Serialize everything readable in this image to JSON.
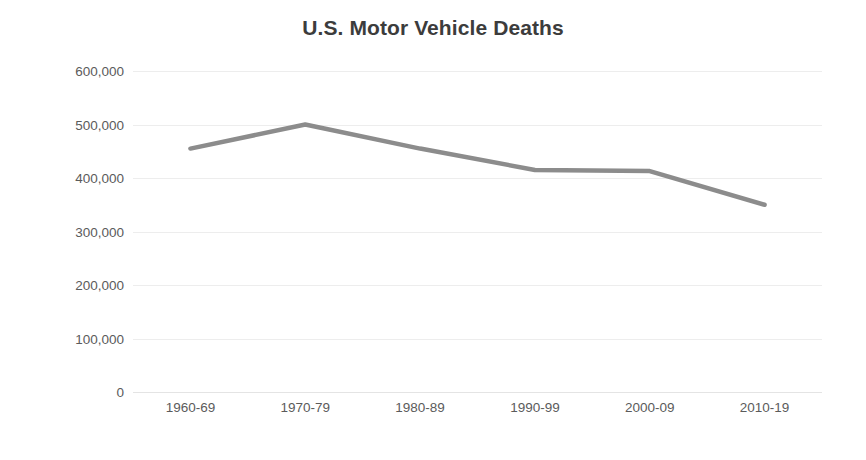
{
  "chart_data": {
    "type": "line",
    "title": "U.S. Motor Vehicle Deaths",
    "xlabel": "",
    "ylabel": "",
    "categories": [
      "1960-69",
      "1970-79",
      "1980-89",
      "1990-99",
      "2000-09",
      "2010-19"
    ],
    "values": [
      455000,
      500000,
      455000,
      415000,
      413000,
      350000
    ],
    "series": [
      {
        "name": "U.S. Motor Vehicle Deaths",
        "values": [
          455000,
          500000,
          455000,
          415000,
          413000,
          350000
        ]
      }
    ],
    "ylim": [
      0,
      600000
    ],
    "y_ticks": [
      0,
      100000,
      200000,
      300000,
      400000,
      500000,
      600000
    ],
    "y_tick_labels": [
      "0",
      "100,000",
      "200,000",
      "300,000",
      "400,000",
      "500,000",
      "600,000"
    ],
    "grid": true,
    "legend": false,
    "legend_position": "none",
    "line_color": "#8c8c8c",
    "grid_color": "#ededed",
    "text_color": "#5b5b5b",
    "title_color": "#3c3c3c",
    "background_color": "#ffffff"
  }
}
